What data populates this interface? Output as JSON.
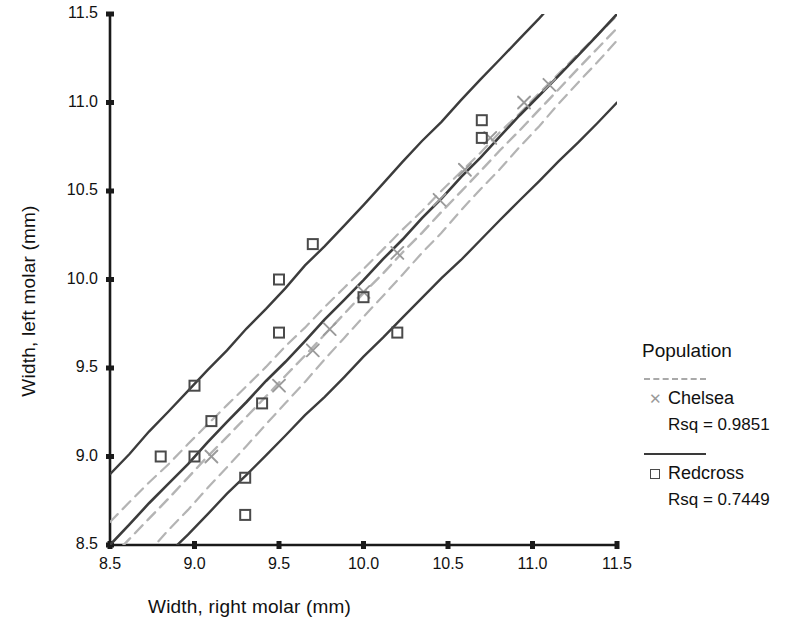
{
  "chart_data": {
    "type": "scatter",
    "title": "",
    "xlabel": "Width, right molar (mm)",
    "ylabel": "Width, left molar (mm)",
    "xlim": [
      8.5,
      11.5
    ],
    "ylim": [
      8.5,
      11.5
    ],
    "xticks": [
      "8.5",
      "9.0",
      "9.5",
      "10.0",
      "10.5",
      "11.0",
      "11.5"
    ],
    "yticks": [
      "8.5",
      "9.0",
      "9.5",
      "10.0",
      "10.5",
      "11.0",
      "11.5"
    ],
    "xtick_values": [
      8.5,
      9.0,
      9.5,
      10.0,
      10.5,
      11.0,
      11.5
    ],
    "ytick_values": [
      8.5,
      9.0,
      9.5,
      10.0,
      10.5,
      11.0,
      11.5
    ],
    "grid": false,
    "legend_position": "right",
    "legend_title": "Population",
    "series": [
      {
        "name": "Chelsea",
        "rsq_label": "Rsq = 0.9851",
        "rsq": 0.9851,
        "marker": "x",
        "color": "#9a9a9a",
        "line_style": "dashed",
        "points": [
          [
            9.1,
            9.0
          ],
          [
            9.5,
            9.4
          ],
          [
            9.7,
            9.6
          ],
          [
            9.8,
            9.72
          ],
          [
            10.0,
            9.93
          ],
          [
            10.2,
            10.15
          ],
          [
            10.45,
            10.45
          ],
          [
            10.6,
            10.62
          ],
          [
            10.75,
            10.8
          ],
          [
            10.95,
            11.0
          ],
          [
            11.1,
            11.1
          ]
        ],
        "fit_line": {
          "x": [
            8.5,
            11.5
          ],
          "y": [
            8.42,
            11.42
          ]
        },
        "band_upper": {
          "x": [
            8.5,
            11.5
          ],
          "y": [
            8.63,
            11.49
          ]
        },
        "band_lower": {
          "x": [
            8.5,
            11.5
          ],
          "y": [
            8.22,
            11.35
          ]
        }
      },
      {
        "name": "Redcross",
        "rsq_label": "Rsq = 0.7449",
        "rsq": 0.7449,
        "marker": "square",
        "color": "#4a4a4a",
        "line_style": "solid",
        "points": [
          [
            8.8,
            9.0
          ],
          [
            9.0,
            9.0
          ],
          [
            9.1,
            9.2
          ],
          [
            9.0,
            9.4
          ],
          [
            9.3,
            8.88
          ],
          [
            9.3,
            8.67
          ],
          [
            9.4,
            9.3
          ],
          [
            9.5,
            9.7
          ],
          [
            9.5,
            10.0
          ],
          [
            9.7,
            10.2
          ],
          [
            10.0,
            9.9
          ],
          [
            10.2,
            9.7
          ],
          [
            10.7,
            10.9
          ],
          [
            10.7,
            10.8
          ]
        ],
        "fit_line": {
          "x": [
            8.5,
            11.5
          ],
          "y": [
            8.5,
            11.5
          ]
        },
        "band_upper": {
          "x": [
            8.5,
            11.5
          ],
          "y": [
            8.9,
            11.95
          ]
        },
        "band_lower": {
          "x": [
            8.5,
            11.5
          ],
          "y": [
            8.12,
            11.0
          ]
        }
      }
    ]
  },
  "axes": {
    "xlabel": "Width, right molar (mm)",
    "ylabel": "Width, left molar (mm)"
  },
  "legend": {
    "title": "Population",
    "entries": [
      {
        "label": "Chelsea",
        "rsq": "Rsq = 0.9851",
        "marker": "x-marker",
        "line": "dashed-gray-line"
      },
      {
        "label": "Redcross",
        "rsq": "Rsq = 0.7449",
        "marker": "square-marker",
        "line": "solid-black-line"
      }
    ]
  },
  "ticks": {
    "x": [
      "8.5",
      "9.0",
      "9.5",
      "10.0",
      "10.5",
      "11.0",
      "11.5"
    ],
    "y": [
      "8.5",
      "9.0",
      "9.5",
      "10.0",
      "10.5",
      "11.0",
      "11.5"
    ]
  }
}
